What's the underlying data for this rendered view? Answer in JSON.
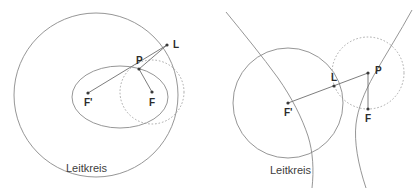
{
  "figure": {
    "background_color": "#ffffff",
    "stroke_color": "#8a8a8a",
    "label_color": "#2b2b2b",
    "width": 419,
    "height": 193
  },
  "left_diagram": {
    "name": "ellipse-leitkreis-construction",
    "caption": "Leitkreis",
    "caption_pos": {
      "x": 96,
      "y": 168
    },
    "directrix_circle": {
      "label": "Leitkreis",
      "center": {
        "x": 96,
        "y": 95
      },
      "radius": 82,
      "style": "solid"
    },
    "conic": {
      "type": "ellipse",
      "center": {
        "x": 120,
        "y": 97
      },
      "semi_major": 48,
      "semi_minor": 31,
      "style": "solid"
    },
    "focal_circle": {
      "center_point": "F",
      "center": {
        "x": 152,
        "y": 92
      },
      "radius": 32,
      "style": "dashed"
    },
    "points": [
      {
        "label": "L",
        "x": 167,
        "y": 45,
        "label_dx": 6,
        "label_dy": 3
      },
      {
        "label": "P",
        "x": 139,
        "y": 69,
        "label_dx": -3,
        "label_dy": -5
      },
      {
        "label": "F'",
        "x": 88,
        "y": 93,
        "label_dx": -4,
        "label_dy": 13
      },
      {
        "label": "F",
        "x": 152,
        "y": 92,
        "label_dx": -3,
        "label_dy": 14
      }
    ],
    "segments": [
      {
        "from": "F'",
        "to": "L",
        "comment": "ray from second focus through P to directrix circle"
      },
      {
        "from": "P",
        "to": "L",
        "comment": "upper radius of focal circle"
      },
      {
        "from": "P",
        "to": "F",
        "comment": "focal radius"
      }
    ]
  },
  "right_diagram": {
    "name": "hyperbola-leitkreis-construction",
    "caption": "Leitkreis",
    "caption_pos": {
      "x": 300,
      "y": 170
    },
    "directrix_circle": {
      "label": "Leitkreis",
      "center": {
        "x": 288,
        "y": 103
      },
      "radius": 55,
      "style": "solid"
    },
    "conic": {
      "type": "hyperbola",
      "center": {
        "x": 348,
        "y": 100
      },
      "a": 26,
      "b": 30,
      "rotation_deg": -8,
      "style": "solid"
    },
    "focal_circle": {
      "center_point": "P",
      "center": {
        "x": 368,
        "y": 73
      },
      "radius": 36,
      "style": "dashed"
    },
    "points": [
      {
        "label": "L",
        "x": 334,
        "y": 82,
        "label_dx": -1,
        "label_dy": -5
      },
      {
        "label": "P",
        "x": 368,
        "y": 73,
        "label_dx": 6,
        "label_dy": 1
      },
      {
        "label": "F'",
        "x": 288,
        "y": 103,
        "label_dx": -4,
        "label_dy": 14
      },
      {
        "label": "F",
        "x": 368,
        "y": 109,
        "label_dx": -3,
        "label_dy": 14
      }
    ],
    "segments": [
      {
        "from": "F'",
        "to": "P",
        "comment": "ray from second focus through L to P"
      },
      {
        "from": "P",
        "to": "F",
        "comment": "focal radius, equals radius of dashed circle"
      }
    ]
  }
}
